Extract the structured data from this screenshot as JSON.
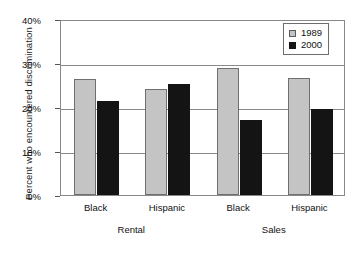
{
  "chart_data": {
    "type": "bar",
    "title": "",
    "xlabel": "",
    "ylabel": "Percent who encountered discrimination",
    "ylim": [
      0,
      40
    ],
    "yticks": [
      "0%",
      "10%",
      "20%",
      "30%",
      "40%"
    ],
    "ytick_values": [
      0,
      10,
      20,
      30,
      40
    ],
    "grid": true,
    "legend_position": "top-right",
    "categories": [
      "Black",
      "Hispanic",
      "Black",
      "Hispanic"
    ],
    "groups": [
      {
        "label": "Rental",
        "categories": [
          "Black",
          "Hispanic"
        ]
      },
      {
        "label": "Sales",
        "categories": [
          "Black",
          "Hispanic"
        ]
      }
    ],
    "series": [
      {
        "name": "1989",
        "color": "#c4c4c4",
        "values": [
          26.3,
          24.0,
          28.8,
          26.6
        ]
      },
      {
        "name": "2000",
        "color": "#141414",
        "values": [
          21.4,
          25.3,
          17.0,
          19.6
        ]
      }
    ]
  },
  "legend": {
    "items": [
      {
        "label": "1989",
        "swatch": "light-gray"
      },
      {
        "label": "2000",
        "swatch": "black"
      }
    ]
  }
}
